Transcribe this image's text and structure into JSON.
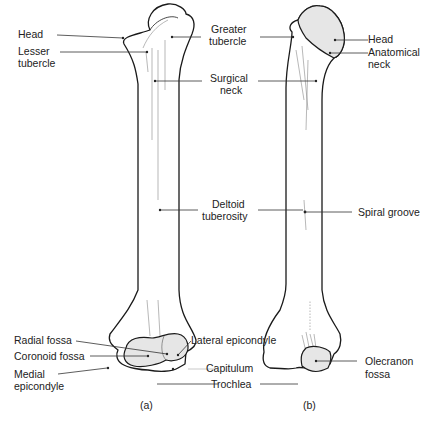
{
  "figure": {
    "panels": [
      {
        "id": "a",
        "caption": "(a)"
      },
      {
        "id": "b",
        "caption": "(b)"
      }
    ]
  },
  "labels": {
    "a_left": {
      "head": "Head",
      "lesser_tubercle_1": "Lesser",
      "lesser_tubercle_2": "tubercle",
      "radial_fossa": "Radial fossa",
      "coronoid_fossa": "Coronoid fossa",
      "medial_epicondyle_1": "Medial",
      "medial_epicondyle_2": "epicondyle"
    },
    "center": {
      "greater_tubercle_1": "Greater",
      "greater_tubercle_2": "tubercle",
      "surgical_neck_1": "Surgical",
      "surgical_neck_2": "neck",
      "deltoid_tuberosity_1": "Deltoid",
      "deltoid_tuberosity_2": "tuberosity",
      "lateral_epicondyle": "Lateral epicondyle",
      "capitulum": "Capitulum",
      "trochlea": "Trochlea"
    },
    "b_right": {
      "head": "Head",
      "anatomical_neck_1": "Anatomical",
      "anatomical_neck_2": "neck",
      "spiral_groove": "Spiral groove",
      "olecranon_fossa_1": "Olecranon",
      "olecranon_fossa_2": "fossa"
    }
  }
}
